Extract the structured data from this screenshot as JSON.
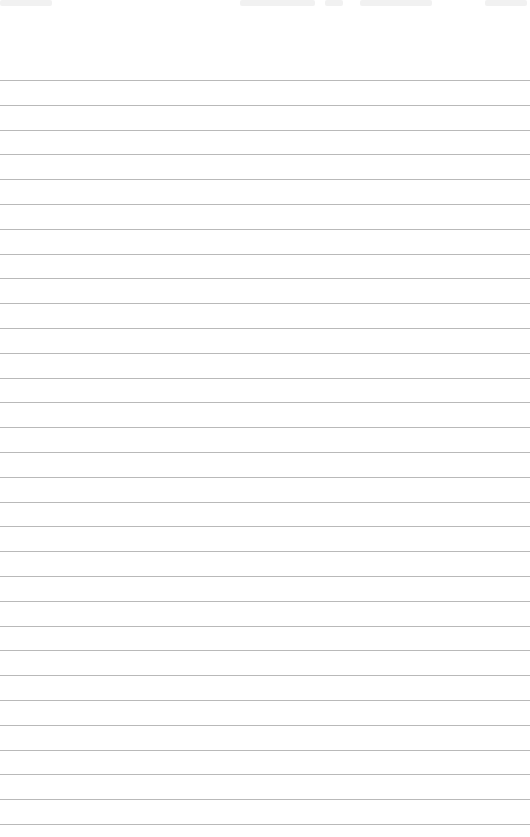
{
  "page": {
    "type": "lined-paper",
    "background_color": "#ffffff",
    "line_color": "#b9b9b9",
    "first_line_y": 80,
    "line_spacing": 24.8,
    "line_count": 31
  }
}
